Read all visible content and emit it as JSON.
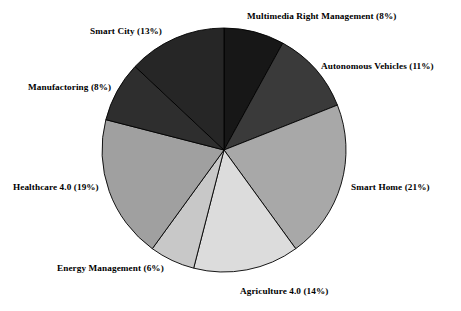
{
  "chart_data": {
    "type": "pie",
    "title": "",
    "subtitle": "",
    "xlabel": "",
    "ylabel": "",
    "legend_position": "none",
    "grid": false,
    "label_format": "name (value%)",
    "start_angle_deg": 0,
    "direction": "clockwise",
    "categories": [
      "Multimedia Right Management",
      "Autonomous Vehicles",
      "Smart Home",
      "Agriculture 4.0",
      "Energy Management",
      "Healthcare 4.0",
      "Manufactoring",
      "Smart City"
    ],
    "values": [
      8,
      11,
      21,
      14,
      6,
      19,
      8,
      13
    ],
    "units": "%",
    "total": 100,
    "colors": [
      "#171717",
      "#3a3a3a",
      "#a8a8a8",
      "#dcdcdc",
      "#c8c8c8",
      "#a0a0a0",
      "#2e2e2e",
      "#262626"
    ],
    "slice_border_color": "#000000",
    "background_color": "#ffffff",
    "text_color": "#000000",
    "slices": [
      {
        "label": "Multimedia Right Management (8%)",
        "name": "Multimedia Right Management",
        "value": 8,
        "color": "#171717"
      },
      {
        "label": "Autonomous Vehicles (11%)",
        "name": "Autonomous Vehicles",
        "value": 11,
        "color": "#3a3a3a"
      },
      {
        "label": "Smart Home (21%)",
        "name": "Smart Home",
        "value": 21,
        "color": "#a8a8a8"
      },
      {
        "label": "Agriculture 4.0 (14%)",
        "name": "Agriculture 4.0",
        "value": 14,
        "color": "#dcdcdc"
      },
      {
        "label": "Energy Management (6%)",
        "name": "Energy Management",
        "value": 6,
        "color": "#c8c8c8"
      },
      {
        "label": "Healthcare 4.0 (19%)",
        "name": "Healthcare 4.0",
        "value": 19,
        "color": "#a0a0a0"
      },
      {
        "label": "Manufactoring (8%)",
        "name": "Manufactoring",
        "value": 8,
        "color": "#2e2e2e"
      },
      {
        "label": "Smart City (13%)",
        "name": "Smart City",
        "value": 13,
        "color": "#262626"
      }
    ],
    "geometry": {
      "center_x": 224,
      "center_y": 150,
      "radius": 122
    }
  }
}
